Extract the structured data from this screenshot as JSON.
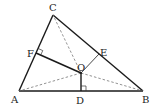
{
  "diagram": {
    "type": "geometry",
    "points": {
      "A": {
        "label": "A",
        "x": 19,
        "y": 91
      },
      "B": {
        "label": "B",
        "x": 143,
        "y": 91
      },
      "C": {
        "label": "C",
        "x": 53,
        "y": 15
      },
      "D": {
        "label": "D",
        "x": 81,
        "y": 91
      },
      "E": {
        "label": "E",
        "x": 99,
        "y": 54
      },
      "F": {
        "label": "F",
        "x": 36,
        "y": 53
      },
      "O": {
        "label": "O",
        "x": 81,
        "y": 73
      }
    },
    "segments": {
      "solid": [
        "AB",
        "BC",
        "CA",
        "OD",
        "OF"
      ],
      "thin": [
        "OE"
      ],
      "dashed": [
        "OA",
        "OB",
        "OC"
      ]
    },
    "right_angles": [
      "ODB",
      "OFA"
    ],
    "colors": {
      "line": "#1a1a1a",
      "dashed": "#777777",
      "background": "#ffffff"
    }
  }
}
